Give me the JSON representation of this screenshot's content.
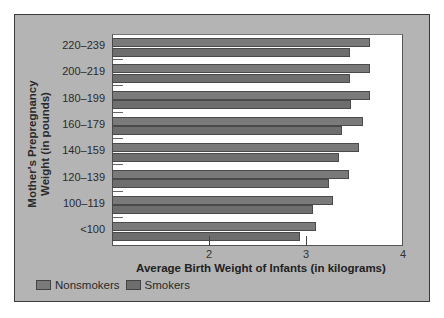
{
  "chart_data": {
    "type": "bar",
    "orientation": "horizontal",
    "title": "",
    "xlabel": "Average Birth Weight of Infants (in kilograms)",
    "ylabel": "Mother's Prepregnancy Weight (in pounds)",
    "xlim": [
      1,
      4
    ],
    "xticks": [
      2,
      3,
      4
    ],
    "grid": false,
    "legend_position": "bottom-left",
    "categories": [
      "220–239",
      "200–219",
      "180–199",
      "160–179",
      "140–159",
      "120–139",
      "100–119",
      "<100"
    ],
    "series": [
      {
        "name": "Nonsmokers",
        "color": "#7a7a7a",
        "values": [
          3.66,
          3.66,
          3.66,
          3.59,
          3.55,
          3.44,
          3.28,
          3.1
        ]
      },
      {
        "name": "Smokers",
        "color": "#6e6e6e",
        "values": [
          3.45,
          3.45,
          3.46,
          3.37,
          3.34,
          3.24,
          3.07,
          2.94
        ]
      }
    ]
  },
  "labels": {
    "ylabel_line1": "Mother's Prepregnancy",
    "ylabel_line2": "Weight (in pounds)",
    "xlabel": "Average Birth Weight of Infants (in kilograms)",
    "legend_nonsmokers": "Nonsmokers",
    "legend_smokers": "Smokers",
    "tick_2": "2",
    "tick_3": "3",
    "tick_4": "4"
  }
}
